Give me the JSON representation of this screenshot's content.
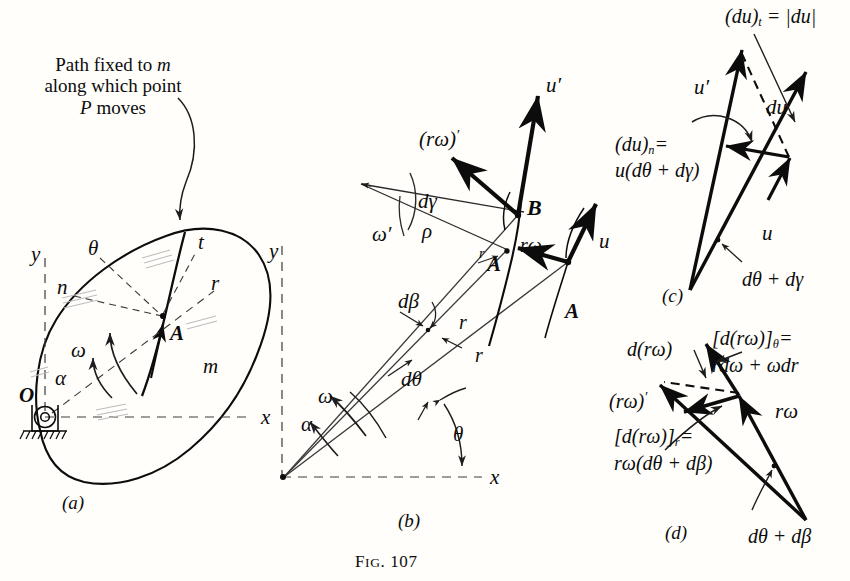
{
  "figure": {
    "caption_prefix": "F",
    "caption_small": "IG",
    "caption_rest": ". 107",
    "caption_full": "FIG. 107"
  },
  "panel_a": {
    "caption": "(a)",
    "note_line1_a": "Path fixed to ",
    "note_line1_b": "m",
    "note_line2": "along which point",
    "note_line3_a": "P",
    "note_line3_b": " moves",
    "labels": {
      "y": "y",
      "x": "x",
      "theta": "θ",
      "n": "n",
      "t": "t",
      "r": "r",
      "A": "A",
      "omega": "ω",
      "alpha": "α",
      "O": "O",
      "m": "m"
    }
  },
  "panel_b": {
    "caption": "(b)",
    "labels": {
      "y": "y",
      "x": "x",
      "rw_prime": "(rω)",
      "rw_prime_sup": "′",
      "dgamma": "dγ",
      "omega_prime": "ω′",
      "rho": "ρ",
      "B": "B",
      "A_upper": "A",
      "A_lower": "A",
      "u_prime": "u′",
      "u": "u",
      "rw": "rω",
      "r_small_upper": "r",
      "r_mid": "r",
      "r_low": "r",
      "dbeta": "dβ",
      "dtheta": "dθ",
      "omega": "ω",
      "alpha": "α",
      "theta": "θ"
    }
  },
  "panel_c": {
    "caption": "(c)",
    "labels": {
      "du_t": "(du)",
      "du_t_sub": "t",
      "du_t_eq": " = |du|",
      "u_prime": "u′",
      "du": "du",
      "du_n_1": "(du)",
      "du_n_sub": "n",
      "du_n_eq": "=",
      "du_n_2": "u(dθ + dγ)",
      "u": "u",
      "angle": "dθ + dγ"
    }
  },
  "panel_d": {
    "caption": "(d)",
    "labels": {
      "drw": "d(rω)",
      "drw_theta_1": "[d(rω)]",
      "drw_theta_sub": "θ",
      "drw_theta_eq": "=",
      "drw_theta_2": "rdω + ωdr",
      "rw_prime": "(rω)",
      "rw_prime_sup": "′",
      "drw_r_1": "[d(rω)]",
      "drw_r_sub": "r",
      "drw_r_eq": "=",
      "drw_r_2": "rω(dθ + dβ)",
      "rw": "rω",
      "angle": "dθ + dβ"
    }
  },
  "style": {
    "ink": "#0c0c0c",
    "thin": "#2a2a2a",
    "dash": "#3a3a3a"
  }
}
